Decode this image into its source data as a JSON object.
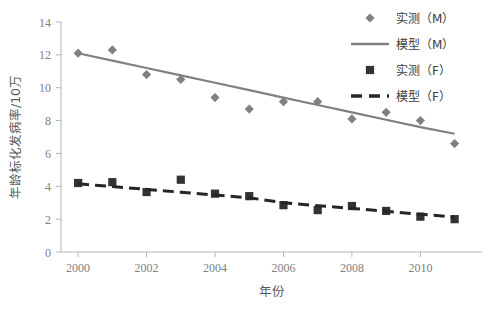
{
  "chart_data": {
    "type": "scatter",
    "title": "",
    "xlabel": "年份",
    "ylabel": "年龄标化发病率/10万",
    "xlim": [
      1999.5,
      2011.8
    ],
    "ylim": [
      0,
      14
    ],
    "ytick_labels": [
      "0",
      "2",
      "4",
      "6",
      "8",
      "10",
      "12",
      "14"
    ],
    "ytick_values": [
      0,
      2,
      4,
      6,
      8,
      10,
      12,
      14
    ],
    "xtick_labels": [
      "2000",
      "2002",
      "2004",
      "2006",
      "2008",
      "2010"
    ],
    "xtick_values": [
      2000,
      2002,
      2004,
      2006,
      2008,
      2010
    ],
    "grid": false,
    "legend_position": "top-right",
    "x": [
      2000,
      2001,
      2002,
      2003,
      2004,
      2005,
      2006,
      2007,
      2008,
      2009,
      2010,
      2011
    ],
    "series": [
      {
        "name": "实测（M）",
        "kind": "scatter",
        "marker": "diamond",
        "color": "#808080",
        "values": [
          12.1,
          12.3,
          10.8,
          10.5,
          9.4,
          8.7,
          9.15,
          9.15,
          8.1,
          8.5,
          8.0,
          6.6
        ]
      },
      {
        "name": "模型（M）",
        "kind": "line",
        "marker": "solid-line",
        "color": "#808080",
        "values": [
          12.1,
          11.65,
          11.2,
          10.75,
          10.3,
          9.85,
          9.4,
          8.95,
          8.5,
          8.05,
          7.6,
          7.2
        ]
      },
      {
        "name": "实测（F）",
        "kind": "scatter",
        "marker": "square",
        "color": "#333333",
        "values": [
          4.2,
          4.25,
          3.65,
          4.4,
          3.55,
          3.4,
          2.85,
          2.55,
          2.8,
          2.5,
          2.15,
          2.0
        ]
      },
      {
        "name": "模型（F）",
        "kind": "line",
        "marker": "dashed-line",
        "color": "#262626",
        "values": [
          4.15,
          3.98,
          3.81,
          3.64,
          3.47,
          3.3,
          3.0,
          2.82,
          2.65,
          2.48,
          2.3,
          2.12
        ]
      }
    ]
  },
  "legend": {
    "items": [
      {
        "label": "实测（M）",
        "marker": "diamond-marker-icon"
      },
      {
        "label": "模型（M）",
        "marker": "solid-line-icon"
      },
      {
        "label": "实测（F）",
        "marker": "square-marker-icon"
      },
      {
        "label": "模型（F）",
        "marker": "dashed-line-icon"
      }
    ]
  }
}
